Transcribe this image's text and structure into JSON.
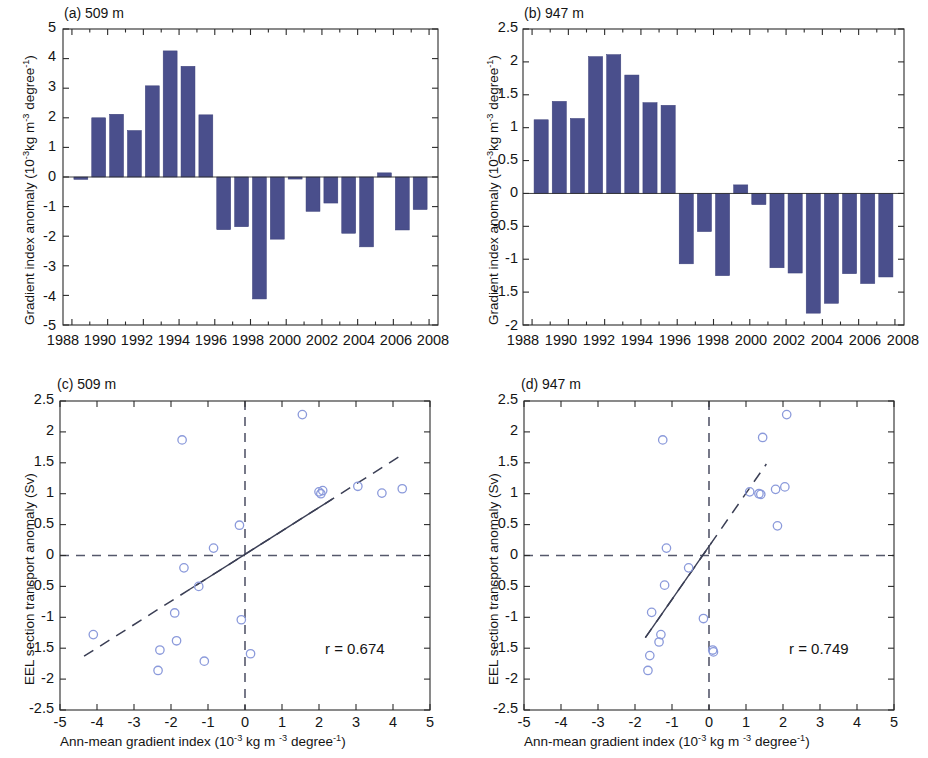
{
  "figure": {
    "width": 928,
    "height": 758,
    "bar_color": "#4a4f8c",
    "marker_color": "#8b9adb",
    "axis_color": "#2b2b2b"
  },
  "panels": {
    "a": {
      "title": "(a) 509 m",
      "ylabel_text": "Gradient index anomaly (10",
      "ylabel_sup1": "-3",
      "ylabel_mid": "kg m",
      "ylabel_sup2": "-3",
      "ylabel_mid2": " degree",
      "ylabel_sup3": "-1",
      "ylabel_end": ")",
      "yticks": [
        "5",
        "4",
        "3",
        "2",
        "1",
        "0",
        "-1",
        "-2",
        "-3",
        "-4",
        "-5"
      ],
      "xticks": [
        "1988",
        "1990",
        "1992",
        "1994",
        "1996",
        "1998",
        "2000",
        "2002",
        "2004",
        "2006",
        "2008"
      ]
    },
    "b": {
      "title": "(b) 947 m",
      "ylabel_text": "Gradient index anomaly (10",
      "ylabel_sup1": "-3",
      "ylabel_mid": "kg m",
      "ylabel_sup2": "-3",
      "ylabel_mid2": " degree",
      "ylabel_sup3": "-1",
      "ylabel_end": ")",
      "yticks": [
        "2.5",
        "2",
        "1.5",
        "1",
        "0.5",
        "0",
        "-0.5",
        "-1",
        "-1.5",
        "-2"
      ],
      "xticks": [
        "1988",
        "1990",
        "1992",
        "1994",
        "1996",
        "1998",
        "2000",
        "2002",
        "2004",
        "2006",
        "2008"
      ]
    },
    "c": {
      "title": "(c) 509 m",
      "ylabel": "EEL section transport anomaly (Sv)",
      "xlabel_pre": "Ann-mean gradient index (10",
      "xlabel_sup1": "-3",
      "xlabel_mid": " kg m ",
      "xlabel_sup2": "-3",
      "xlabel_mid2": " degree",
      "xlabel_sup3": "-1",
      "xlabel_end": ")",
      "yticks": [
        "2.5",
        "2",
        "1.5",
        "1",
        "0.5",
        "0",
        "-0.5",
        "-1",
        "-1.5",
        "-2",
        "-2.5"
      ],
      "xticks": [
        "-5",
        "-4",
        "-3",
        "-2",
        "-1",
        "0",
        "1",
        "2",
        "3",
        "4",
        "5"
      ],
      "r_label": "r = 0.674"
    },
    "d": {
      "title": "(d) 947 m",
      "ylabel": "EEL section transport anomaly (Sv)",
      "xlabel_pre": "Ann-mean gradient index (10",
      "xlabel_sup1": "-3",
      "xlabel_mid": " kg m ",
      "xlabel_sup2": "-3",
      "xlabel_mid2": " degree",
      "xlabel_sup3": "-1",
      "xlabel_end": ")",
      "yticks": [
        "2.5",
        "2",
        "1.5",
        "1",
        "0.5",
        "0",
        "-0.5",
        "-1",
        "-1.5",
        "-2",
        "-2.5"
      ],
      "xticks": [
        "-5",
        "-4",
        "-3",
        "-2",
        "-1",
        "0",
        "1",
        "2",
        "3",
        "4",
        "5"
      ],
      "r_label": "r = 0.749"
    }
  },
  "chart_data": [
    {
      "type": "bar",
      "panel": "a",
      "title": "(a) 509 m",
      "xlabel": "",
      "ylabel": "Gradient index anomaly (10^-3 kg m^-3 degree^-1)",
      "xlim": [
        1987.5,
        2008.5
      ],
      "ylim": [
        -5,
        5
      ],
      "yticks": [
        5,
        4,
        3,
        2,
        1,
        0,
        -1,
        -2,
        -3,
        -4,
        -5
      ],
      "xticks": [
        1988,
        1990,
        1992,
        1994,
        1996,
        1998,
        2000,
        2002,
        2004,
        2006,
        2008
      ],
      "grid": false,
      "categories": [
        1988,
        1989,
        1990,
        1991,
        1992,
        1993,
        1994,
        1995,
        1996,
        1997,
        1998,
        1999,
        2000,
        2001,
        2002,
        2003,
        2004,
        2005,
        2006,
        2007
      ],
      "values": [
        -0.08,
        2.0,
        2.12,
        1.57,
        3.08,
        4.26,
        3.74,
        2.1,
        -1.78,
        -1.68,
        -4.12,
        -2.1,
        -0.07,
        -1.16,
        -0.88,
        -1.9,
        -2.36,
        0.14,
        -1.79,
        -1.1
      ]
    },
    {
      "type": "bar",
      "panel": "b",
      "title": "(b) 947 m",
      "xlabel": "",
      "ylabel": "Gradient index anomaly (10^-3 kg m^-3 degree^-1)",
      "xlim": [
        1987.5,
        2008.5
      ],
      "ylim": [
        -2,
        2.5
      ],
      "yticks": [
        2.5,
        2,
        1.5,
        1,
        0.5,
        0,
        -0.5,
        -1,
        -1.5,
        -2
      ],
      "xticks": [
        1988,
        1990,
        1992,
        1994,
        1996,
        1998,
        2000,
        2002,
        2004,
        2006,
        2008
      ],
      "grid": false,
      "categories": [
        1988,
        1989,
        1990,
        1991,
        1992,
        1993,
        1994,
        1995,
        1996,
        1997,
        1998,
        1999,
        2000,
        2001,
        2002,
        2003,
        2004,
        2005,
        2006,
        2007
      ],
      "values": [
        1.12,
        1.4,
        1.14,
        2.08,
        2.11,
        1.8,
        1.38,
        1.34,
        -1.07,
        -0.58,
        -1.25,
        0.13,
        -0.17,
        -1.13,
        -1.21,
        -1.82,
        -1.67,
        -1.22,
        -1.37,
        -1.27
      ]
    },
    {
      "type": "scatter",
      "panel": "c",
      "title": "(c) 509 m",
      "xlabel": "Ann-mean gradient index (10^-3 kg m^-3 degree^-1)",
      "ylabel": "EEL section transport anomaly (Sv)",
      "xlim": [
        -5,
        5
      ],
      "ylim": [
        -2.5,
        2.5
      ],
      "xticks": [
        -5,
        -4,
        -3,
        -2,
        -1,
        0,
        1,
        2,
        3,
        4,
        5
      ],
      "yticks": [
        2.5,
        2,
        1.5,
        1,
        0.5,
        0,
        -0.5,
        -1,
        -1.5,
        -2,
        -2.5
      ],
      "grid": false,
      "annotation": "r = 0.674",
      "correlation": 0.674,
      "x": [
        -4.1,
        -2.35,
        -2.3,
        -1.9,
        -1.85,
        -1.7,
        -1.65,
        -1.25,
        -1.1,
        -0.85,
        -0.15,
        -0.1,
        0.15,
        1.55,
        2.0,
        2.05,
        2.1,
        3.05,
        3.7,
        4.25
      ],
      "y": [
        -1.28,
        -1.86,
        -1.53,
        -0.93,
        -1.38,
        1.87,
        -0.2,
        -0.5,
        -1.71,
        0.12,
        0.49,
        -1.04,
        -1.59,
        2.28,
        1.03,
        1.0,
        1.05,
        1.12,
        1.01,
        1.08
      ],
      "fit_line": {
        "x0": -4.35,
        "y0": -1.63,
        "x1": 4.25,
        "y1": 1.63,
        "style": "dashed-with-solid-segment"
      },
      "reference_lines": {
        "vertical_x": 0,
        "horizontal_y": 0
      }
    },
    {
      "type": "scatter",
      "panel": "d",
      "title": "(d) 947 m",
      "xlabel": "Ann-mean gradient index (10^-3 kg m^-3 degree^-1)",
      "ylabel": "EEL section transport anomaly (Sv)",
      "xlim": [
        -5,
        5
      ],
      "ylim": [
        -2.5,
        2.5
      ],
      "xticks": [
        -5,
        -4,
        -3,
        -2,
        -1,
        0,
        1,
        2,
        3,
        4,
        5
      ],
      "yticks": [
        2.5,
        2,
        1.5,
        1,
        0.5,
        0,
        -0.5,
        -1,
        -1.5,
        -2,
        -2.5
      ],
      "grid": false,
      "annotation": "r = 0.749",
      "correlation": 0.749,
      "x": [
        -1.65,
        -1.6,
        -1.55,
        -1.35,
        -1.3,
        -1.25,
        -1.2,
        -1.15,
        -0.55,
        -0.15,
        0.1,
        0.12,
        1.1,
        1.35,
        1.4,
        1.45,
        1.8,
        1.85,
        2.05,
        2.1
      ],
      "y": [
        -1.86,
        -1.62,
        -0.92,
        -1.4,
        -1.28,
        1.87,
        -0.48,
        0.12,
        -0.2,
        -1.02,
        -1.53,
        -1.56,
        1.03,
        1.0,
        0.99,
        1.91,
        1.07,
        0.48,
        1.11,
        2.28
      ],
      "fit_line": {
        "x0": -1.72,
        "y0": -1.33,
        "x1": 1.55,
        "y1": 1.48,
        "style": "solid-left-dashed-right"
      },
      "reference_lines": {
        "vertical_x": 0,
        "horizontal_y": 0
      }
    }
  ]
}
